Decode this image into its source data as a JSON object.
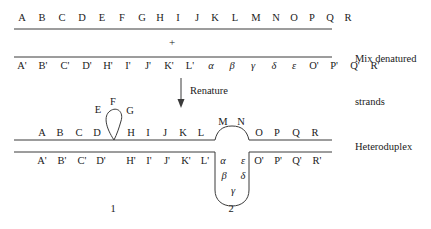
{
  "figure": {
    "title_none": "",
    "side_labels": {
      "top": "Mix denatured\nstrands",
      "top_line1": "Mix denatured",
      "top_line2": "strands",
      "bottom": "Heteroduplex"
    },
    "operator_plus": "+",
    "arrow_label": "Renature",
    "loop_numbers": [
      "1",
      "2"
    ]
  },
  "denatured": {
    "top_strand": {
      "name": "wild-type-strand",
      "letters": [
        "A",
        "B",
        "C",
        "D",
        "E",
        "F",
        "G",
        "H",
        "I",
        "J",
        "K",
        "L",
        "M",
        "N",
        "O",
        "P",
        "Q",
        "R"
      ],
      "x": [
        22,
        42,
        62,
        82,
        102,
        122,
        142,
        160,
        178,
        196,
        214,
        234,
        254,
        274,
        292,
        310,
        328,
        346
      ]
    },
    "bottom_strand": {
      "name": "mutant-strand",
      "letters": [
        "A'",
        "B'",
        "C'",
        "D'",
        "H'",
        "I'",
        "J'",
        "K'",
        "L'",
        "α",
        "β",
        "γ",
        "δ",
        "ε",
        "O'",
        "P'",
        "Q'",
        "R'"
      ],
      "x": [
        22,
        42,
        62,
        82,
        102,
        122,
        140,
        160,
        180,
        200,
        220,
        240,
        260,
        280,
        300,
        320,
        340,
        360
      ]
    }
  },
  "heteroduplex": {
    "top_strand": {
      "name": "heteroduplex-top",
      "paired_left": [
        "A",
        "B",
        "C",
        "D"
      ],
      "loop1_letters": [
        "E",
        "F",
        "G"
      ],
      "paired_middle": [
        "H",
        "I",
        "J",
        "K",
        "L"
      ],
      "loop2_letters": [
        "M",
        "N"
      ],
      "paired_right": [
        "O",
        "P",
        "Q",
        "R"
      ]
    },
    "bottom_strand": {
      "name": "heteroduplex-bottom",
      "paired_left": [
        "A'",
        "B'",
        "C'",
        "D'"
      ],
      "paired_middle": [
        "H'",
        "I'",
        "J'",
        "K'",
        "L'"
      ],
      "loop2_letters": [
        "α",
        "ε",
        "β",
        "δ",
        "γ"
      ],
      "paired_right": [
        "O'",
        "P'",
        "Q'",
        "R'"
      ]
    }
  },
  "colors": {
    "ink": "#171717",
    "line": "#3a3a3a",
    "background": "#ffffff"
  }
}
